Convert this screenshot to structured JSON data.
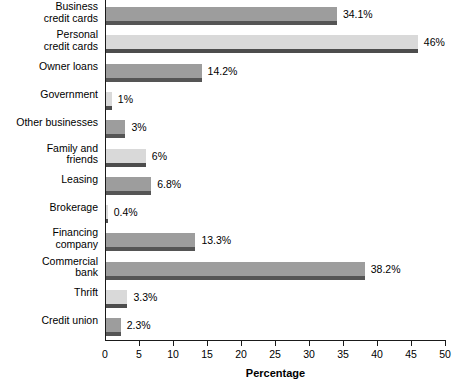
{
  "chart_data": {
    "type": "bar",
    "orientation": "horizontal",
    "title": "",
    "xlabel": "Percentage",
    "ylabel": "",
    "xlim": [
      0,
      50
    ],
    "xticks": [
      0,
      5,
      10,
      15,
      20,
      25,
      30,
      35,
      40,
      45,
      50
    ],
    "grid": false,
    "legend": false,
    "categories": [
      "Business\ncredit cards",
      "Personal\ncredit cards",
      "Owner loans",
      "Government",
      "Other businesses",
      "Family and\nfriends",
      "Leasing",
      "Brokerage",
      "Financing\ncompany",
      "Commercial\nbank",
      "Thrift",
      "Credit union"
    ],
    "values": [
      34.1,
      46,
      14.2,
      1,
      3,
      6,
      6.8,
      0.4,
      13.3,
      38.2,
      3.3,
      2.3
    ],
    "data_labels": [
      "34.1%",
      "46%",
      "14.2%",
      "1%",
      "3%",
      "6%",
      "6.8%",
      "0.4%",
      "13.3%",
      "38.2%",
      "3.3%",
      "2.3%"
    ],
    "bar_shades": [
      "dark",
      "light",
      "dark",
      "light",
      "dark",
      "light",
      "dark",
      "light",
      "dark",
      "dark",
      "light",
      "dark"
    ],
    "colors": {
      "bar_dark": "#9d9d9d",
      "bar_light": "#d9d9d9",
      "bar_base_dark": "#555555",
      "bar_base_light": "#4d4d4d",
      "axis": "#1a1a1a",
      "text": "#000000",
      "background": "#ffffff"
    }
  }
}
